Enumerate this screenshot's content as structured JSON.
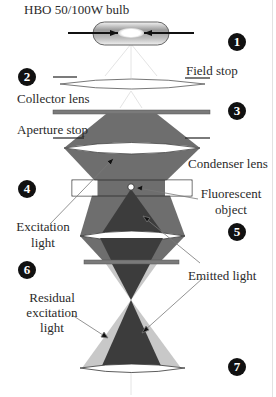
{
  "labels": {
    "bulb": "HBO 50/100W bulb",
    "field_stop": "Field stop",
    "collector_lens": "Collector lens",
    "aperture_stop": "Aperture stop",
    "condenser_lens": "Condenser lens",
    "fluorescent_object_line1": "Fluorescent",
    "fluorescent_object_line2": "object",
    "excitation_light_line1": "Excitation",
    "excitation_light_line2": "light",
    "emitted_light": "Emitted light",
    "residual_line1": "Residual",
    "residual_line2": "excitation",
    "residual_line3": "light"
  },
  "badges": [
    "1",
    "2",
    "3",
    "4",
    "5",
    "6",
    "7"
  ],
  "colors": {
    "excitation": "#6e6e6e",
    "emitted": "#3c3c3c",
    "residual": "#c8c8c8",
    "filter": "#7a7a7a",
    "lens_fill": "#ffffff",
    "badge": "#111111"
  }
}
